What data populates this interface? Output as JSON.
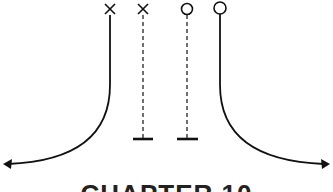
{
  "diagram": {
    "players": [
      {
        "id": "x1",
        "symbol": "X",
        "x": 110,
        "y": 9,
        "route": "solid-curve-left"
      },
      {
        "id": "x2",
        "symbol": "X",
        "x": 143,
        "y": 9,
        "route": "dashed-block"
      },
      {
        "id": "o1",
        "symbol": "O",
        "x": 187,
        "y": 9,
        "route": "dashed-block"
      },
      {
        "id": "o2",
        "symbol": "O",
        "x": 220,
        "y": 8,
        "route": "solid-curve-right"
      }
    ],
    "colors": {
      "stroke": "#111111",
      "background": "#ffffff"
    }
  },
  "caption": {
    "text": "CHAPTER 10"
  }
}
